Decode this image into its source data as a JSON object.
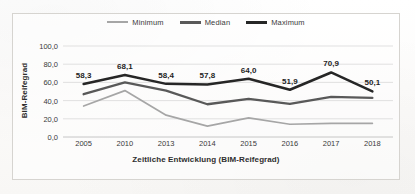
{
  "chart_data": {
    "type": "line",
    "title": "",
    "subtitle": "",
    "xlabel": "Zeitliche Entwicklung (BIM-Reifegrad)",
    "ylabel": "BIM-Reifegrad",
    "categories": [
      "2005",
      "2010",
      "2013",
      "2014",
      "2015",
      "2016",
      "2017",
      "2018"
    ],
    "ylim": [
      0.0,
      100.0
    ],
    "y_ticks": [
      "0,0",
      "20,0",
      "40,0",
      "60,0",
      "80,0",
      "100,0"
    ],
    "y_tick_values": [
      0.0,
      20.0,
      40.0,
      60.0,
      80.0,
      100.0
    ],
    "grid": true,
    "legend_position": "top-center",
    "decimal_separator": ",",
    "series": [
      {
        "name": "Minimum",
        "color": "#a6a6a6",
        "values": [
          34.0,
          51.0,
          24.0,
          12.0,
          21.0,
          14.0,
          15.0,
          15.0
        ],
        "labels_shown": false
      },
      {
        "name": "Median",
        "color": "#595959",
        "values": [
          47.0,
          60.0,
          51.0,
          36.0,
          42.0,
          36.5,
          44.0,
          43.0
        ],
        "labels_shown": false
      },
      {
        "name": "Maximum",
        "color": "#262626",
        "values": [
          58.3,
          68.1,
          58.4,
          57.8,
          64.0,
          51.9,
          70.9,
          50.1
        ],
        "labels_shown": true,
        "data_labels": [
          "58,3",
          "68,1",
          "58,4",
          "57,8",
          "64,0",
          "51,9",
          "70,9",
          "50,1"
        ]
      }
    ]
  }
}
